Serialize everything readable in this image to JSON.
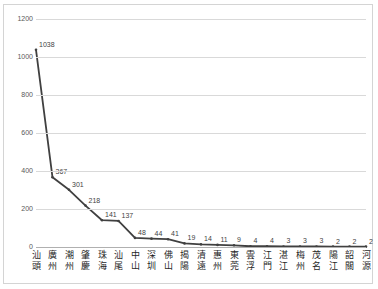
{
  "chart_data": {
    "type": "line",
    "title": "",
    "subtitle": "",
    "xlabel": "",
    "ylabel": "",
    "ylim": [
      0,
      1200
    ],
    "ytick_labels": [
      "0",
      "200",
      "400",
      "600",
      "800",
      "1000",
      "1200"
    ],
    "yticks": [
      0,
      200,
      400,
      600,
      800,
      1000,
      1200
    ],
    "grid": true,
    "legend": false,
    "legend_position": "none",
    "series_color": "#404040",
    "categories": [
      "汕頭",
      "廣州",
      "潮州",
      "肇慶",
      "珠海",
      "汕尾",
      "中山",
      "深圳",
      "佛山",
      "揭陽",
      "清遠",
      "惠州",
      "東莞",
      "雲浮",
      "江門",
      "湛江",
      "梅州",
      "茂名",
      "陽江",
      "韶關",
      "河源"
    ],
    "values": [
      1038,
      367,
      301,
      218,
      141,
      137,
      48,
      44,
      41,
      19,
      14,
      11,
      9,
      4,
      4,
      3,
      3,
      3,
      2,
      2,
      2
    ],
    "data_labels": [
      "1038",
      "367",
      "301",
      "218",
      "141",
      "137",
      "48",
      "44",
      "41",
      "19",
      "14",
      "11",
      "9",
      "4",
      "4",
      "3",
      "3",
      "3",
      "2",
      "2",
      "2"
    ]
  },
  "frame": {
    "border_color": "#d4d4d4",
    "gridline_color": "#d9d9d9",
    "axis_color": "#b0b0b0",
    "tick_text_color": "#595959",
    "label_text_color": "#3f3f3f"
  }
}
